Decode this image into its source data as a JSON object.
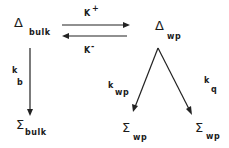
{
  "diagram": {
    "type": "reaction-kinetics-scheme",
    "nodes": {
      "delta_bulk": {
        "symbol": "Δ",
        "subscript": "bulk"
      },
      "delta_wp": {
        "symbol": "Δ",
        "subscript": "wp"
      },
      "sigma_bulk": {
        "symbol": "Σ",
        "subscript": "bulk"
      },
      "sigma_wp_left": {
        "symbol": "Σ",
        "subscript": "wp"
      },
      "sigma_wp_right": {
        "symbol": "Σ",
        "subscript": "wp"
      }
    },
    "edges": {
      "forward": {
        "from": "delta_bulk",
        "to": "delta_wp",
        "k": "K",
        "sup": "+"
      },
      "reverse": {
        "from": "delta_wp",
        "to": "delta_bulk",
        "k": "K",
        "sup": "-"
      },
      "bulk_decay": {
        "from": "delta_bulk",
        "to": "sigma_bulk",
        "k": "k",
        "sub": "b"
      },
      "wp_decay": {
        "from": "delta_wp",
        "to": "sigma_wp_left",
        "k": "k",
        "sub": "wp"
      },
      "quench": {
        "from": "delta_wp",
        "to": "sigma_wp_right",
        "k": "k",
        "sub": "q"
      }
    },
    "colors": {
      "ink": "#222222",
      "background": "#ffffff"
    }
  }
}
